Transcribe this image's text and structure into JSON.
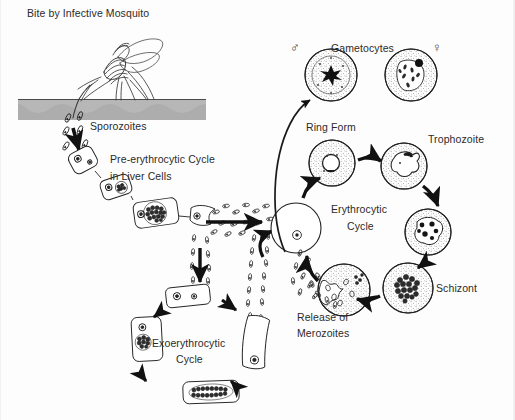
{
  "figure": {
    "title": "Bite by Infective Mosquito",
    "background_color": "#fdfdfd",
    "ink_color": "#1a1a1a",
    "skin_color": "#a8a8a8"
  },
  "labels": {
    "bite": "Bite by Infective Mosquito",
    "sporozoites": "Sporozoites",
    "pre_erythrocytic_line1": "Pre-erythrocytic Cycle",
    "pre_erythrocytic_line2": "in Liver Cells",
    "exo_line1": "Exoerythrocytic",
    "exo_line2": "Cycle",
    "gametocytes": "Gametocytes",
    "male_symbol": "♂",
    "female_symbol": "♀",
    "ring_form": "Ring Form",
    "trophozoite": "Trophozoite",
    "erythrocytic_line1": "Erythrocytic",
    "erythrocytic_line2": "Cycle",
    "schizont": "Schizont",
    "release_line1": "Release of",
    "release_line2": "Merozoites"
  },
  "stages": [
    {
      "name": "sporozoites",
      "label": "Sporozoites",
      "host": "human skin / bloodstream"
    },
    {
      "name": "pre-erythrocytic-cycle",
      "label": "Pre-erythrocytic Cycle in Liver Cells",
      "host": "liver"
    },
    {
      "name": "exoerythrocytic-cycle",
      "label": "Exoerythrocytic Cycle",
      "host": "liver"
    },
    {
      "name": "ring-form",
      "label": "Ring Form",
      "host": "erythrocyte"
    },
    {
      "name": "trophozoite",
      "label": "Trophozoite",
      "host": "erythrocyte"
    },
    {
      "name": "schizont",
      "label": "Schizont",
      "host": "erythrocyte"
    },
    {
      "name": "release-of-merozoites",
      "label": "Release of Merozoites",
      "host": "erythrocyte"
    },
    {
      "name": "erythrocytic-cycle",
      "label": "Erythrocytic Cycle",
      "host": "blood"
    },
    {
      "name": "gametocyte-male",
      "label": "Gametocytes",
      "symbol": "♂"
    },
    {
      "name": "gametocyte-female",
      "label": "Gametocytes",
      "symbol": "♀"
    }
  ]
}
